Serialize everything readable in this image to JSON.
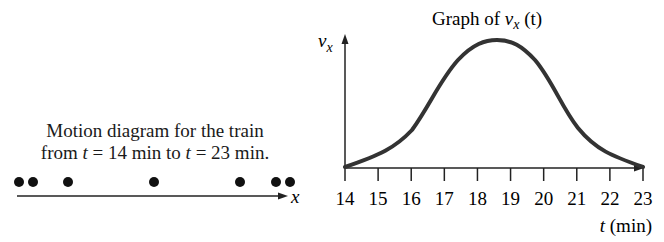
{
  "motion_diagram": {
    "caption_line1": "Motion diagram for the train",
    "caption_line2_prefix": "from ",
    "caption_t1": "t",
    "caption_mid": " = 14 min to ",
    "caption_t2": "t",
    "caption_suffix": " = 23 min.",
    "axis_label": "x",
    "dot_positions_px": [
      19,
      33,
      68,
      154,
      240,
      276,
      290
    ]
  },
  "graph": {
    "title_prefix": "Graph of ",
    "title_var": "v",
    "title_sub": "x",
    "title_suffix": " (t)",
    "y_axis_label": "v",
    "y_axis_sub": "x",
    "x_axis_label_var": "t",
    "x_axis_label_unit": " (min)",
    "x_ticks": [
      "14",
      "15",
      "16",
      "17",
      "18",
      "19",
      "20",
      "21",
      "22",
      "23"
    ]
  },
  "chart_data": {
    "type": "line",
    "xlabel": "t (min)",
    "ylabel": "vx",
    "x": [
      14,
      15,
      16,
      17,
      18,
      18.5,
      19,
      20,
      21,
      22,
      23
    ],
    "series": [
      {
        "name": "vx(t) (relative, peak = 1)",
        "values": [
          0.0,
          0.12,
          0.3,
          0.7,
          0.97,
          1.0,
          0.97,
          0.7,
          0.32,
          0.12,
          0.0
        ]
      }
    ],
    "xlim": [
      14,
      23
    ],
    "grid": false,
    "legend": "none"
  }
}
